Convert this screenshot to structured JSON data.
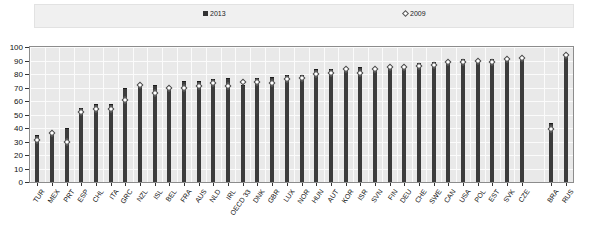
{
  "legend": {
    "entries": [
      {
        "label": "2013",
        "marker": "filled-square",
        "color": "#333333"
      },
      {
        "label": "2009",
        "marker": "open-diamond",
        "color": "#ffffff"
      }
    ]
  },
  "chart_data": {
    "type": "bar",
    "title": "",
    "xlabel": "",
    "ylabel": "",
    "ylim": [
      0,
      100
    ],
    "yticks": [
      0,
      10,
      20,
      30,
      40,
      50,
      60,
      70,
      80,
      90,
      100
    ],
    "grid": true,
    "legend_position": "top",
    "categories": [
      "TUR",
      "MEX",
      "PRT",
      "ESP",
      "CHL",
      "ITA",
      "GRC",
      "NZL",
      "ISL",
      "BEL",
      "FRA",
      "AUS",
      "NLD",
      "IRL",
      "OECD 33",
      "DNK",
      "GBR",
      "LUX",
      "NOR",
      "HUN",
      "AUT",
      "KOR",
      "ISR",
      "SVN",
      "FIN",
      "DEU",
      "CHE",
      "SWE",
      "CAN",
      "USA",
      "POL",
      "EST",
      "SVK",
      "CZE",
      "BRA",
      "RUS"
    ],
    "series": [
      {
        "name": "2013",
        "marker": "bar",
        "values": [
          35,
          38,
          40,
          55,
          58,
          58,
          70,
          72,
          72,
          71,
          75,
          75,
          76,
          77,
          72,
          77,
          78,
          79,
          79,
          84,
          84,
          85,
          85,
          85,
          86,
          87,
          88,
          89,
          90,
          91,
          91,
          91,
          92,
          92,
          44,
          95
        ]
      },
      {
        "name": "2009",
        "marker": "diamond",
        "values": [
          31,
          36,
          30,
          52,
          54,
          54,
          61,
          72,
          66,
          70,
          70,
          71,
          73,
          71,
          74,
          74,
          73,
          76,
          77,
          80,
          81,
          84,
          81,
          84,
          85,
          85,
          86,
          87,
          89,
          89,
          90,
          89,
          91,
          92,
          39,
          94
        ]
      }
    ]
  }
}
